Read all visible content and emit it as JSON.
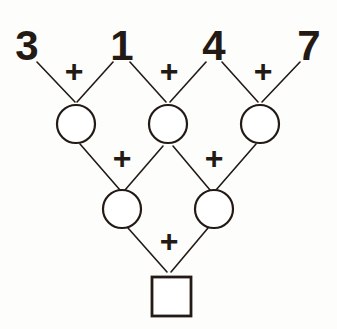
{
  "diagram": {
    "type": "addition-pyramid",
    "ink_color": "#231a16",
    "background_color": "#fdfdfc",
    "operator_symbol": "+",
    "rows": [
      {
        "row_index": 0,
        "shape": "none",
        "cells": [
          {
            "label": "3",
            "filled": true
          },
          {
            "label": "1",
            "filled": true
          },
          {
            "label": "4",
            "filled": true
          },
          {
            "label": "7",
            "filled": true
          }
        ]
      },
      {
        "row_index": 1,
        "shape": "circle",
        "cells": [
          {
            "label": "",
            "filled": false
          },
          {
            "label": "",
            "filled": false
          },
          {
            "label": "",
            "filled": false
          }
        ]
      },
      {
        "row_index": 2,
        "shape": "circle",
        "cells": [
          {
            "label": "",
            "filled": false
          },
          {
            "label": "",
            "filled": false
          }
        ]
      },
      {
        "row_index": 3,
        "shape": "square",
        "cells": [
          {
            "label": "",
            "filled": false
          }
        ]
      }
    ],
    "operators": {
      "row0_to_row1": [
        "+",
        "+",
        "+"
      ],
      "row1_to_row2": [
        "+",
        "+"
      ],
      "row2_to_row3": [
        "+"
      ]
    }
  }
}
